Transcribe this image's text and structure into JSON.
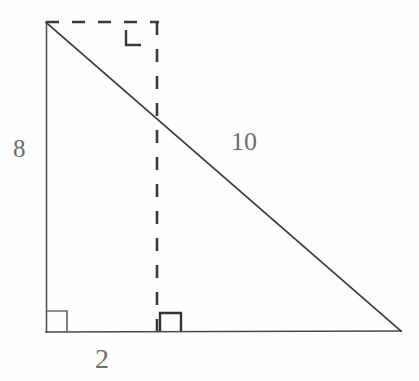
{
  "figure": {
    "kind": "right-triangle-geometry-diagram",
    "background_color": "#fefefe",
    "stroke_color": "#3a3a3a",
    "label_color": "#6d6d6d",
    "labels": {
      "vertical_leg": "8",
      "hypotenuse": "10",
      "base_segment": "2"
    },
    "vertices": {
      "top_left": [
        46,
        22
      ],
      "bottom_left": [
        46,
        332
      ],
      "bottom_right": [
        401,
        331
      ],
      "top_right_construction": [
        157,
        22
      ],
      "dashed_intersection": [
        157,
        119
      ]
    },
    "solid_edges": [
      {
        "name": "vertical-leg",
        "from": [
          46,
          22
        ],
        "to": [
          46,
          332
        ]
      },
      {
        "name": "base-leg",
        "from": [
          46,
          332
        ],
        "to": [
          401,
          331
        ]
      },
      {
        "name": "hypotenuse",
        "from": [
          46,
          22
        ],
        "to": [
          401,
          331
        ]
      }
    ],
    "dashed_edges": [
      {
        "name": "top-construction-line",
        "from": [
          46,
          22
        ],
        "to": [
          158,
          22
        ]
      },
      {
        "name": "vertical-construction-line",
        "from": [
          157,
          22
        ],
        "to": [
          157,
          332
        ]
      }
    ],
    "right_angle_markers": [
      {
        "name": "bottom-left-right-angle",
        "style": "full-square",
        "size": 20
      },
      {
        "name": "bottom-middle-right-angle",
        "style": "open-corner",
        "size": 20
      },
      {
        "name": "top-right-right-angle",
        "style": "open-corner",
        "size": 16
      }
    ]
  }
}
